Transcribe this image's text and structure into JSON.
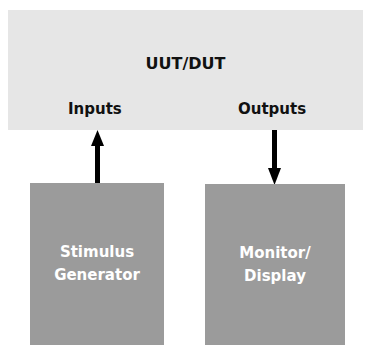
{
  "uut": {
    "title": "UUT/DUT",
    "inputs_label": "Inputs",
    "outputs_label": "Outputs"
  },
  "blocks": {
    "stimulus": {
      "line1": "Stimulus",
      "line2": "Generator"
    },
    "monitor": {
      "line1": "Monitor/",
      "line2": "Display"
    }
  },
  "arrows": [
    {
      "from": "Stimulus Generator",
      "to": "Inputs",
      "direction": "up"
    },
    {
      "from": "Outputs",
      "to": "Monitor/Display",
      "direction": "down"
    }
  ],
  "colors": {
    "uut_fill": "#e6e6e6",
    "block_fill": "#9b9b9b",
    "arrow": "#000000"
  }
}
